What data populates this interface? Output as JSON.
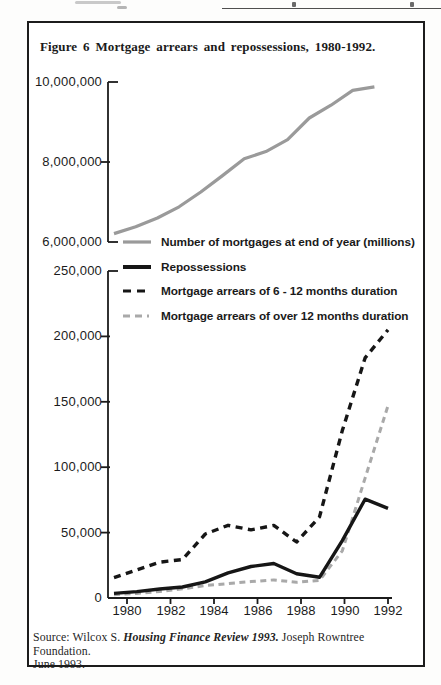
{
  "figure": {
    "title": "Figure 6 Mortgage arrears and repossessions, 1980-1992.",
    "source": {
      "prefix": "Source: Wilcox S. ",
      "emphasis": "Housing Finance Review 1993.",
      "suffix": " Joseph Rowntree Foundation.",
      "line2": "June 1993."
    }
  },
  "colors": {
    "ink": "#1b1b1b",
    "mortgages_line": "#9a9a9a",
    "repossessions_line": "#161616",
    "arrears_6_12_line": "#161616",
    "arrears_over_12_line": "#a9a9a9"
  },
  "legend": [
    {
      "label": "Number of mortgages at end of year (millions)",
      "style": "solid",
      "color": "#9a9a9a"
    },
    {
      "label": "Repossessions",
      "style": "solid",
      "color": "#161616"
    },
    {
      "label": "Mortgage arrears of 6 - 12 months duration",
      "style": "dashed",
      "color": "#161616"
    },
    {
      "label": "Mortgage arrears of over 12 months duration",
      "style": "dashed",
      "color": "#a9a9a9"
    }
  ],
  "chart_data": [
    {
      "type": "line",
      "title": "Number of mortgages at end of year",
      "x": [
        1980,
        1981,
        1982,
        1983,
        1984,
        1985,
        1986,
        1987,
        1988,
        1989,
        1990,
        1991,
        1992
      ],
      "series": [
        {
          "name": "Number of mortgages at end of year (millions)",
          "color": "#9a9a9a",
          "dash": null,
          "width": 3.2,
          "values": [
            6210000,
            6380000,
            6600000,
            6880000,
            7250000,
            7660000,
            8080000,
            8260000,
            8560000,
            9100000,
            9420000,
            9790000,
            9880000
          ]
        }
      ],
      "ylim": [
        6000000,
        10000000
      ],
      "yticks": [
        6000000,
        8000000,
        10000000
      ],
      "ytick_labels": [
        "6,000,000",
        "8,000,000",
        "10,000,000"
      ],
      "xticks": [],
      "xtick_labels": [],
      "grid": false,
      "legend_position": "below-left"
    },
    {
      "type": "line",
      "title": "Repossessions and mortgage arrears",
      "x": [
        1980,
        1981,
        1982,
        1983,
        1984,
        1985,
        1986,
        1987,
        1988,
        1989,
        1990,
        1991,
        1992
      ],
      "series": [
        {
          "name": "Mortgage arrears of over 12 months duration",
          "color": "#a9a9a9",
          "dash": "6,4.5",
          "width": 3,
          "values": [
            2500,
            3500,
            5000,
            7000,
            9500,
            11000,
            12500,
            13800,
            12000,
            13500,
            36100,
            91700,
            147000
          ]
        },
        {
          "name": "Repossessions",
          "color": "#161616",
          "dash": null,
          "width": 3.4,
          "values": [
            3500,
            4900,
            6900,
            8400,
            12400,
            19300,
            24100,
            26400,
            18500,
            15800,
            43900,
            75500,
            68500
          ]
        },
        {
          "name": "Mortgage arrears of 6 - 12 months duration",
          "color": "#161616",
          "dash": "7,5.5",
          "width": 3.4,
          "values": [
            15500,
            21500,
            27400,
            29400,
            48900,
            55600,
            52100,
            55500,
            42800,
            62000,
            128000,
            183600,
            205000
          ]
        }
      ],
      "ylim": [
        0,
        250000
      ],
      "yticks": [
        0,
        50000,
        100000,
        150000,
        200000,
        250000
      ],
      "ytick_labels": [
        "0",
        "50,000",
        "100,000",
        "150,000",
        "200,000",
        "250,000"
      ],
      "xticks": [
        1980,
        1982,
        1984,
        1986,
        1988,
        1990,
        1992
      ],
      "xtick_labels": [
        "1980",
        "1982",
        "1984",
        "1986",
        "1988",
        "1990",
        "1992"
      ],
      "grid": false,
      "legend_position": "above-left"
    }
  ]
}
